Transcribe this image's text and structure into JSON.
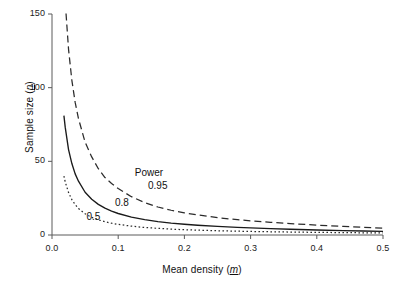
{
  "chart_data": {
    "type": "line",
    "title": "",
    "xlabel": "Mean density (m)",
    "xlabel_plain": "Mean density",
    "xlabel_symbol": "m",
    "ylabel": "Sample size (n)",
    "ylabel_plain": "Sample size",
    "ylabel_symbol": "n",
    "xlim": [
      0.0,
      0.5
    ],
    "ylim": [
      0,
      150
    ],
    "grid": false,
    "legend_position": "inline-annotations",
    "legend_title": "Power",
    "xticks": [
      0.0,
      0.1,
      0.2,
      0.3,
      0.4,
      0.5
    ],
    "xtick_labels": [
      "0.0",
      "0.1",
      "0.2",
      "0.3",
      "0.4",
      "0.5"
    ],
    "yticks": [
      0,
      50,
      100,
      150
    ],
    "ytick_labels": [
      "0",
      "50",
      "100",
      "150"
    ],
    "series": [
      {
        "name": "0.95",
        "label": "0.95",
        "style": "dashed",
        "color": "#2b2b2b",
        "x": [
          0.015,
          0.018,
          0.02,
          0.025,
          0.03,
          0.035,
          0.04,
          0.05,
          0.06,
          0.07,
          0.08,
          0.09,
          0.1,
          0.12,
          0.14,
          0.16,
          0.18,
          0.2,
          0.22,
          0.25,
          0.28,
          0.3,
          0.33,
          0.36,
          0.4,
          0.44,
          0.47,
          0.5
        ],
        "y": [
          210,
          175,
          158,
          126,
          105,
          90,
          79,
          63,
          53,
          45,
          39,
          35,
          31.5,
          26,
          22,
          19,
          16.8,
          15,
          13.6,
          11.8,
          10.4,
          9.6,
          8.6,
          7.7,
          6.7,
          5.8,
          5.2,
          4.6
        ]
      },
      {
        "name": "0.8",
        "label": "0.8",
        "style": "solid",
        "color": "#1a1a1a",
        "x": [
          0.018,
          0.02,
          0.025,
          0.03,
          0.035,
          0.04,
          0.05,
          0.06,
          0.07,
          0.08,
          0.09,
          0.1,
          0.12,
          0.14,
          0.16,
          0.18,
          0.2,
          0.22,
          0.25,
          0.28,
          0.3,
          0.33,
          0.36,
          0.4,
          0.44,
          0.47,
          0.5
        ],
        "y": [
          81,
          73,
          58,
          48.5,
          41.5,
          36.5,
          29,
          24.3,
          20.8,
          18.2,
          16.2,
          14.6,
          12.1,
          10.4,
          9.1,
          8.1,
          7.3,
          6.6,
          5.8,
          5.2,
          4.8,
          4.3,
          3.9,
          3.4,
          3.0,
          2.7,
          2.5
        ]
      },
      {
        "name": "0.5",
        "label": "0.5",
        "style": "dotted",
        "color": "#2b2b2b",
        "x": [
          0.018,
          0.02,
          0.025,
          0.03,
          0.035,
          0.04,
          0.05,
          0.06,
          0.07,
          0.08,
          0.09,
          0.1,
          0.12,
          0.14,
          0.16,
          0.18,
          0.2,
          0.22,
          0.25,
          0.28,
          0.3,
          0.33,
          0.36,
          0.4,
          0.44,
          0.47,
          0.5
        ],
        "y": [
          40,
          36,
          28.8,
          24,
          20.6,
          18,
          14.4,
          12,
          10.3,
          9,
          8,
          7.2,
          6,
          5.1,
          4.5,
          4.0,
          3.6,
          3.3,
          2.9,
          2.6,
          2.4,
          2.2,
          2.0,
          1.8,
          1.6,
          1.5,
          1.4
        ]
      }
    ],
    "annotations": [
      {
        "text": "Power",
        "x": 0.125,
        "y": 42
      },
      {
        "text": "0.95",
        "x": 0.145,
        "y": 33
      },
      {
        "text": "0.8",
        "x": 0.095,
        "y": 22
      },
      {
        "text": "0.5",
        "x": 0.052,
        "y": 12
      }
    ]
  },
  "axes": {
    "y_title_prefix": "Sample size (",
    "y_title_symbol": "n",
    "y_title_suffix": ")",
    "x_title_prefix": "Mean density (",
    "x_title_symbol": "m",
    "x_title_suffix": ")"
  },
  "colors": {
    "background": "#ffffff",
    "axis": "#555555",
    "text": "#1a1a1a",
    "curve": "#1f1f1f"
  }
}
